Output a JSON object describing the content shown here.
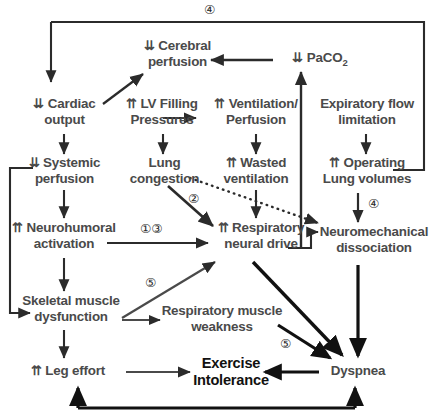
{
  "diagram": {
    "text_color": "#4a4a4a",
    "emphasis_color": "#111111",
    "line_color": "#2b2b2b",
    "nodes": [
      {
        "id": "cerebral-perfusion",
        "line1": "⇊ Cerebral",
        "line2": "perfusion"
      },
      {
        "id": "paco2",
        "line1": "⇊ PaCO",
        "line2": ""
      },
      {
        "id": "cardiac-output",
        "line1": "⇊ Cardiac",
        "line2": "output"
      },
      {
        "id": "lv-filling-pressures",
        "line1": "⇈ LV Filling",
        "line2": "Pressures"
      },
      {
        "id": "ventilation-perfusion",
        "line1": "⇈ Ventilation/",
        "line2": "Perfusion"
      },
      {
        "id": "expiratory-flow-limitation",
        "line1": "Expiratory flow",
        "line2": "limitation"
      },
      {
        "id": "systemic-perfusion",
        "line1": "⇊ Systemic",
        "line2": "perfusion"
      },
      {
        "id": "lung-congestion",
        "line1": "Lung",
        "line2": "congestion"
      },
      {
        "id": "wasted-ventilation",
        "line1": "⇈ Wasted",
        "line2": "ventilation"
      },
      {
        "id": "operating-lung-volumes",
        "line1": "⇈ Operating",
        "line2": "Lung volumes"
      },
      {
        "id": "neurohumoral-activation",
        "line1": "⇈ Neurohumoral",
        "line2": "activation"
      },
      {
        "id": "respiratory-neural-drive",
        "line1": "⇈ Respiratory",
        "line2": "neural drive"
      },
      {
        "id": "neuromechanical-dissociation",
        "line1": "Neuromechanical",
        "line2": "dissociation"
      },
      {
        "id": "skeletal-muscle-dysfunction",
        "line1": "Skeletal muscle",
        "line2": "dysfunction"
      },
      {
        "id": "respiratory-muscle-weakness",
        "line1": "Respiratory muscle",
        "line2": "weakness"
      },
      {
        "id": "leg-effort",
        "line1": "⇈ Leg effort",
        "line2": ""
      },
      {
        "id": "exercise-intolerance",
        "line1": "Exercise",
        "line2": "Intolerance"
      },
      {
        "id": "dyspnea",
        "line1": "Dyspnea",
        "line2": ""
      }
    ],
    "paco2_subscript": "2",
    "markers": [
      {
        "id": "marker-top-4",
        "label": "④"
      },
      {
        "id": "marker-lung-congestion-2",
        "label": "②"
      },
      {
        "id": "marker-neurohumoral-1-3",
        "label": "①③"
      },
      {
        "id": "marker-operating-4",
        "label": "④"
      },
      {
        "id": "marker-skeletal-5",
        "label": "⑤"
      },
      {
        "id": "marker-dyspnea-5",
        "label": "⑤"
      }
    ]
  }
}
